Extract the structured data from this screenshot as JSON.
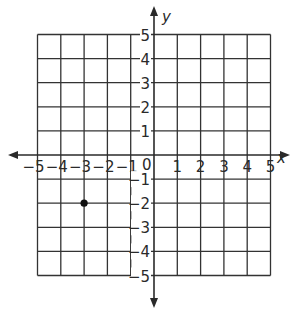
{
  "figure": {
    "type": "coordinate-plane",
    "x_axis_label": "x",
    "y_axis_label": "y",
    "x_range": [
      -5,
      5
    ],
    "y_range": [
      -5,
      5
    ],
    "grid": true,
    "x_tick_labels": [
      "−5",
      "−4",
      "−3",
      "−2",
      "−1",
      "0",
      "1",
      "2",
      "3",
      "4",
      "5"
    ],
    "y_tick_labels": [
      "5",
      "4",
      "3",
      "2",
      "1",
      "−1",
      "−2",
      "−3",
      "−4",
      "−5"
    ],
    "origin_label": "0",
    "points": [
      {
        "x": -3,
        "y": -2,
        "color": "#111111"
      }
    ],
    "colors": {
      "grid": "#333333",
      "axis": "#2a2a2a",
      "background": "#ffffff"
    }
  }
}
